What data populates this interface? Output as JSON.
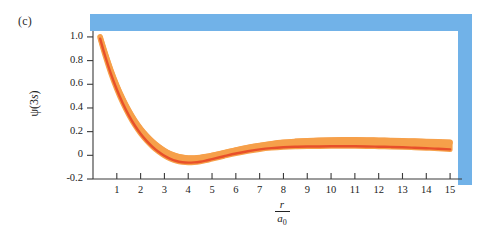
{
  "panel": {
    "label": "(c)"
  },
  "colors": {
    "curve_light": "#F6A04A",
    "curve_dark": "#E8502A",
    "frame_blue": "#71B2E8",
    "axis": "#3a3a3a",
    "text": "#232323",
    "background": "#ffffff"
  },
  "axes": {
    "y_label_prefix": "ψ(3",
    "y_label_italic": "s",
    "y_label_suffix": ")",
    "x_label_numerator": "r",
    "x_label_denominator": "a",
    "x_label_denominator_sub": "0"
  },
  "chart_data": {
    "type": "line",
    "title": "(c)",
    "xlabel": "r/a₀",
    "ylabel": "ψ(3s)",
    "xlim": [
      0,
      15.5
    ],
    "ylim": [
      -0.2,
      1.05
    ],
    "grid": false,
    "legend": "none",
    "xticks": [
      1,
      2,
      3,
      4,
      5,
      6,
      7,
      8,
      9,
      10,
      11,
      12,
      13,
      14,
      15
    ],
    "xtick_labels": [
      "1",
      "2",
      "3",
      "4",
      "5",
      "6",
      "7",
      "8",
      "9",
      "10",
      "11",
      "12",
      "13",
      "14",
      "15"
    ],
    "yticks": [
      -0.2,
      0,
      0.2,
      0.4,
      0.6,
      0.8,
      1.0
    ],
    "ytick_labels": [
      "-0.2",
      "0",
      "0.2",
      "0.4",
      "0.6",
      "0.8",
      "1.0"
    ],
    "series": [
      {
        "name": "psi_3s_upper",
        "color": "#F6A04A",
        "x": [
          0.3,
          0.5,
          0.75,
          1.0,
          1.25,
          1.5,
          1.75,
          2.0,
          2.25,
          2.5,
          2.75,
          3.0,
          3.25,
          3.5,
          3.75,
          4.0,
          4.25,
          4.5,
          4.75,
          5.0,
          5.5,
          6.0,
          6.5,
          7.0,
          7.5,
          8.0,
          8.5,
          9.0,
          9.5,
          10.0,
          10.5,
          11.0,
          11.5,
          12.0,
          12.5,
          13.0,
          13.5,
          14.0,
          14.5,
          15.0
        ],
        "y": [
          1.0,
          0.87,
          0.72,
          0.59,
          0.478,
          0.38,
          0.296,
          0.225,
          0.166,
          0.116,
          0.074,
          0.04,
          0.013,
          -0.005,
          -0.016,
          -0.022,
          -0.022,
          -0.018,
          -0.01,
          0.0,
          0.022,
          0.045,
          0.066,
          0.083,
          0.098,
          0.11,
          0.118,
          0.124,
          0.128,
          0.13,
          0.131,
          0.131,
          0.13,
          0.128,
          0.126,
          0.123,
          0.12,
          0.117,
          0.114,
          0.11
        ]
      },
      {
        "name": "psi_3s_lower",
        "color": "#E8502A",
        "x": [
          0.3,
          0.5,
          0.75,
          1.0,
          1.25,
          1.5,
          1.75,
          2.0,
          2.25,
          2.5,
          2.75,
          3.0,
          3.25,
          3.5,
          3.75,
          4.0,
          4.25,
          4.5,
          4.75,
          5.0,
          5.5,
          6.0,
          6.5,
          7.0,
          7.5,
          8.0,
          8.5,
          9.0,
          9.5,
          10.0,
          10.5,
          11.0,
          11.5,
          12.0,
          12.5,
          13.0,
          13.5,
          14.0,
          14.5,
          15.0
        ],
        "y": [
          0.985,
          0.845,
          0.69,
          0.556,
          0.44,
          0.34,
          0.254,
          0.182,
          0.122,
          0.072,
          0.03,
          -0.004,
          -0.03,
          -0.048,
          -0.058,
          -0.062,
          -0.06,
          -0.054,
          -0.044,
          -0.032,
          -0.008,
          0.015,
          0.034,
          0.05,
          0.061,
          0.068,
          0.072,
          0.074,
          0.075,
          0.076,
          0.076,
          0.076,
          0.075,
          0.073,
          0.071,
          0.068,
          0.064,
          0.06,
          0.056,
          0.05
        ]
      }
    ]
  }
}
